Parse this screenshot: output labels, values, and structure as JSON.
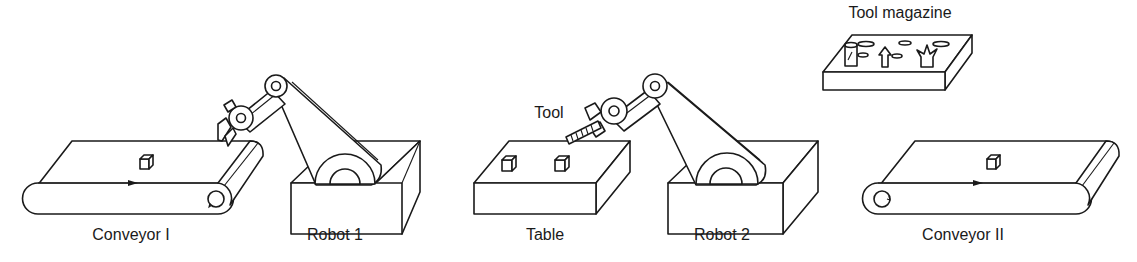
{
  "diagram": {
    "type": "robotic-work-cell",
    "line_color": "#1a1a1a",
    "background": "#ffffff",
    "components": [
      {
        "id": "conveyor-1",
        "label": "Conveyor I",
        "kind": "conveyor",
        "items_on_top": 1,
        "flow_direction": "right"
      },
      {
        "id": "robot-1",
        "label": "Robot 1",
        "kind": "articulated-robot-arm",
        "gripper": "jaw-gripper"
      },
      {
        "id": "table",
        "label": "Table",
        "kind": "table",
        "items_on_top": 2
      },
      {
        "id": "robot-2",
        "label": "Robot 2",
        "kind": "articulated-robot-arm",
        "holding": "Tool"
      },
      {
        "id": "tool-magazine",
        "label": "Tool magazine",
        "kind": "tool-rack",
        "tools": 3
      },
      {
        "id": "conveyor-2",
        "label": "Conveyor II",
        "kind": "conveyor",
        "items_on_top": 1,
        "flow_direction": "right"
      }
    ],
    "annotations": [
      {
        "text": "Tool",
        "points_to": "robot-2 end effector"
      }
    ]
  },
  "labels": {
    "conveyor_1": "Conveyor I",
    "robot_1": "Robot 1",
    "table": "Table",
    "robot_2": "Robot 2",
    "conveyor_2": "Conveyor II",
    "tool": "Tool",
    "tool_magazine": "Tool magazine"
  }
}
